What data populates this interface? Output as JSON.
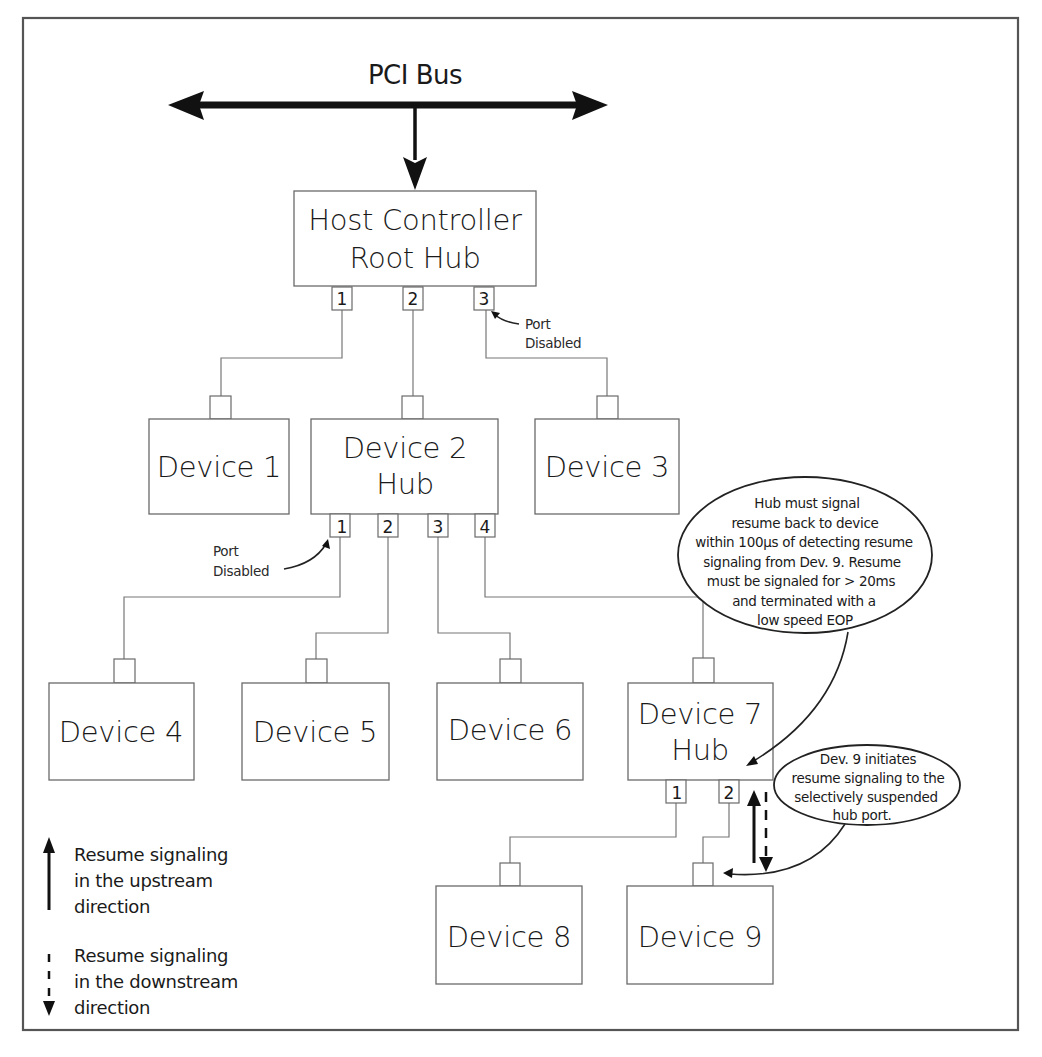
{
  "bus": {
    "label": "PCI Bus"
  },
  "root_hub": {
    "line1": "Host Controller",
    "line2": "Root Hub",
    "ports": [
      "1",
      "2",
      "3"
    ],
    "port3_note": {
      "line1": "Port",
      "line2": "Disabled"
    }
  },
  "tier1": {
    "device1": {
      "label": "Device 1"
    },
    "device2": {
      "line1": "Device 2",
      "line2": "Hub",
      "ports": [
        "1",
        "2",
        "3",
        "4"
      ],
      "port1_note": {
        "line1": "Port",
        "line2": "Disabled"
      }
    },
    "device3": {
      "label": "Device 3"
    }
  },
  "tier2": {
    "device4": {
      "label": "Device 4"
    },
    "device5": {
      "label": "Device 5"
    },
    "device6": {
      "label": "Device 6"
    },
    "device7": {
      "line1": "Device 7",
      "line2": "Hub",
      "ports": [
        "1",
        "2"
      ]
    }
  },
  "tier3": {
    "device8": {
      "label": "Device 8"
    },
    "device9": {
      "label": "Device 9"
    }
  },
  "callouts": {
    "hub_resume": [
      "Hub must signal",
      "resume back to device",
      "within 100µs of detecting resume",
      "signaling from Dev. 9. Resume",
      "must be signaled for > 20ms",
      "and terminated with a",
      "low speed EOP"
    ],
    "dev9_initiates": [
      "Dev. 9 initiates",
      "resume signaling to the",
      "selectively suspended",
      "hub port."
    ]
  },
  "legend": {
    "upstream": [
      "Resume signaling",
      "in the upstream",
      "direction"
    ],
    "downstream": [
      "Resume signaling",
      "in the downstream",
      "direction"
    ]
  }
}
